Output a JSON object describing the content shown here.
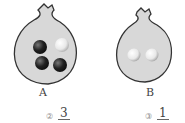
{
  "figure": {
    "bags": [
      {
        "label": "A",
        "balls": [
          "black",
          "white",
          "black",
          "black"
        ],
        "black_count": 3,
        "white_count": 1
      },
      {
        "label": "B",
        "balls": [
          "white",
          "white"
        ],
        "black_count": 0,
        "white_count": 2
      }
    ],
    "colors": {
      "bag_fill": "#d8d8d8",
      "bag_outline": "#333333",
      "black_ball": "#2a2a2a",
      "white_ball": "#f2f2f2"
    }
  },
  "options": [
    {
      "marker": "②",
      "numerator": "3"
    },
    {
      "marker": "③",
      "numerator": "1"
    }
  ]
}
